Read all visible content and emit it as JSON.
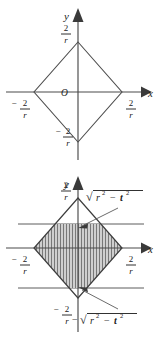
{
  "document": {
    "title": "Diamond region |x|+|y| = 2/r with horizontal strip",
    "figure_count": 2
  },
  "figures": [
    {
      "id": "figure-top",
      "name": "diamond-plot-unshaded",
      "axes": {
        "x_label": "x",
        "y_label": "y",
        "origin_label": "O"
      },
      "tick_labels": {
        "y_top_num": "2",
        "y_top_den": "r",
        "y_bottom_sign": "−",
        "y_bottom_num": "2",
        "y_bottom_den": "r",
        "x_left_sign": "−",
        "x_left_num": "2",
        "x_left_den": "r",
        "x_right_num": "2",
        "x_right_den": "r"
      },
      "shape": {
        "type": "diamond",
        "vertices_label": "(±2/r, 0), (0, ±2/r)",
        "shaded": false
      }
    },
    {
      "id": "figure-bottom",
      "name": "diamond-plot-shaded",
      "axes": {
        "x_label": "x",
        "y_label": "y"
      },
      "tick_labels": {
        "y_top_num": "2",
        "y_top_den": "r",
        "y_bottom_sign": "−",
        "y_bottom_num": "2",
        "y_bottom_den": "r",
        "x_left_sign": "−",
        "x_left_num": "2",
        "x_left_den": "r",
        "x_right_num": "2",
        "x_right_den": "r"
      },
      "annotations": [
        {
          "name": "upper-bound-label",
          "radical_body": "r",
          "exp1": "2",
          "minus": "−",
          "var2": "t",
          "exp2": "2",
          "sign_prefix": "",
          "text": "√(r² − t²)"
        },
        {
          "name": "lower-bound-label",
          "radical_body": "r",
          "exp1": "2",
          "minus": "−",
          "var2": "t",
          "exp2": "2",
          "sign_prefix": "−",
          "text": "−√(r² − t²)"
        }
      ],
      "shape": {
        "type": "diamond",
        "vertices_label": "(±2/r, 0), (0, ±2/r)",
        "shaded": true,
        "shading": "vertical-hatch",
        "strip": "between y = −√(r²−t²) and y = √(r²−t²)"
      }
    }
  ],
  "colors": {
    "line": "#4a4a4a",
    "hatch": "#6e6e6e",
    "fill": "#c9c9c9",
    "text": "#1a1a1a",
    "background": "#ffffff"
  }
}
